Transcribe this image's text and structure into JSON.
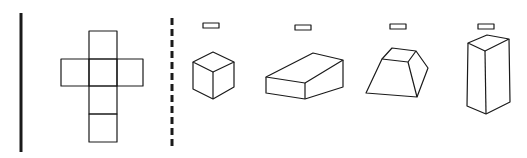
{
  "diagram": {
    "net": {
      "label": "cube-net",
      "shape": "cross",
      "squares": 6
    },
    "options": [
      {
        "id": "1",
        "shape": "cube",
        "answer_box": ""
      },
      {
        "id": "2",
        "shape": "rectangular-box",
        "answer_box": ""
      },
      {
        "id": "3",
        "shape": "frustum",
        "answer_box": ""
      },
      {
        "id": "4",
        "shape": "rectangular-prism-tall",
        "answer_box": ""
      }
    ],
    "colors": {
      "line": "#1a1a1a",
      "background": "#ffffff"
    }
  }
}
